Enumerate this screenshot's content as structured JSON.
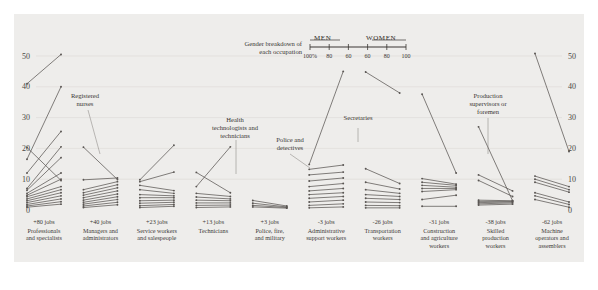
{
  "figure": {
    "background": "#eeedeb",
    "page_background": "#ffffff",
    "line_color": "#5a5653",
    "grid_color": "#dcd9d5"
  },
  "legend": {
    "title_line1": "Gender breakdown of",
    "title_line2": "each occupation",
    "men_label": "MEN",
    "women_label": "WOMEN",
    "ticks": [
      "100%",
      "80",
      "60",
      "60",
      "80",
      "100"
    ]
  },
  "annotations": [
    {
      "id": "registered-nurses",
      "text": "Registered\nnurses"
    },
    {
      "id": "health-technologists",
      "text": "Health\ntechnologists and\ntechnicians"
    },
    {
      "id": "police-and-detectives",
      "text": "Police and\ndetectives"
    },
    {
      "id": "secretaries",
      "text": "Secretaries"
    },
    {
      "id": "production-supervisors",
      "text": "Production\nsupervisors or\nforemen"
    }
  ],
  "chart_data": {
    "type": "line",
    "title": "",
    "subtitle": "",
    "xlabel": "",
    "ylabel": "",
    "ylim": [
      0,
      55
    ],
    "yticks": [
      0,
      10,
      20,
      30,
      40,
      50
    ],
    "ytick_labels": [
      "0",
      "10",
      "20",
      "30",
      "40",
      "50"
    ],
    "grid": true,
    "legend_position": "top-center",
    "axis_left_labels": [
      "0",
      "10",
      "20",
      "30",
      "40",
      "50"
    ],
    "axis_right_labels": [
      "0",
      "10",
      "20",
      "30",
      "40",
      "50"
    ],
    "x_endpoints": [
      "MEN",
      "WOMEN"
    ],
    "categories": [
      {
        "jobs": "+80 jobs",
        "name": "Professionals\nand specialists",
        "pairs": [
          [
            41.0,
            50.5
          ],
          [
            20.3,
            9.6
          ],
          [
            16.5,
            40.0
          ],
          [
            12.0,
            25.5
          ],
          [
            7.0,
            20.5
          ],
          [
            6.4,
            17.0
          ],
          [
            5.4,
            12.0
          ],
          [
            4.8,
            10.0
          ],
          [
            4.3,
            7.6
          ],
          [
            3.6,
            6.6
          ],
          [
            3.0,
            5.6
          ],
          [
            2.4,
            4.6
          ],
          [
            1.8,
            3.6
          ],
          [
            1.3,
            2.7
          ],
          [
            0.9,
            1.9
          ]
        ]
      },
      {
        "jobs": "+40 jobs",
        "name": "Managers and\nadministrators",
        "pairs": [
          [
            20.4,
            9.9
          ],
          [
            9.8,
            10.4
          ],
          [
            6.6,
            9.2
          ],
          [
            5.6,
            8.2
          ],
          [
            4.8,
            7.2
          ],
          [
            4.0,
            6.2
          ],
          [
            3.2,
            5.2
          ],
          [
            2.5,
            4.3
          ],
          [
            1.9,
            3.4
          ],
          [
            1.3,
            2.5
          ],
          [
            0.8,
            1.7
          ]
        ]
      },
      {
        "jobs": "+23 jobs",
        "name": "Service workers\nand salespeople",
        "pairs": [
          [
            9.8,
            21.0
          ],
          [
            9.2,
            12.3
          ],
          [
            8.0,
            6.3
          ],
          [
            6.6,
            5.4
          ],
          [
            5.0,
            4.6
          ],
          [
            4.0,
            4.0
          ],
          [
            3.0,
            3.2
          ],
          [
            2.2,
            2.5
          ],
          [
            1.4,
            1.8
          ],
          [
            0.8,
            1.2
          ]
        ]
      },
      {
        "jobs": "+13 jobs",
        "name": "Technicians",
        "pairs": [
          [
            12.2,
            5.6
          ],
          [
            7.6,
            20.5
          ],
          [
            5.4,
            4.4
          ],
          [
            4.2,
            3.6
          ],
          [
            3.2,
            3.0
          ],
          [
            2.3,
            2.3
          ],
          [
            1.5,
            1.6
          ],
          [
            0.8,
            1.0
          ]
        ]
      },
      {
        "jobs": "+3 jobs",
        "name": "Police, fire,\nand military",
        "pairs": [
          [
            3.1,
            1.3
          ],
          [
            2.2,
            1.0
          ],
          [
            1.5,
            0.8
          ],
          [
            1.0,
            0.6
          ]
        ]
      },
      {
        "jobs": "-3 jobs",
        "name": "Administrative\nsupport workers",
        "pairs": [
          [
            14.8,
            45.0
          ],
          [
            13.2,
            14.6
          ],
          [
            11.4,
            12.3
          ],
          [
            9.4,
            10.4
          ],
          [
            7.6,
            8.6
          ],
          [
            6.2,
            7.0
          ],
          [
            5.0,
            5.6
          ],
          [
            3.8,
            4.4
          ],
          [
            2.6,
            3.2
          ],
          [
            1.5,
            2.0
          ],
          [
            0.7,
            1.0
          ]
        ]
      },
      {
        "jobs": "-26 jobs",
        "name": "Transportation\nworkers",
        "pairs": [
          [
            44.8,
            38.0
          ],
          [
            13.4,
            8.6
          ],
          [
            9.0,
            6.8
          ],
          [
            6.6,
            5.4
          ],
          [
            5.0,
            4.4
          ],
          [
            3.8,
            3.4
          ],
          [
            2.6,
            2.4
          ],
          [
            1.5,
            1.4
          ],
          [
            0.7,
            0.7
          ]
        ]
      },
      {
        "jobs": "-31 jobs",
        "name": "Construction\nand agriculture\nworkers",
        "pairs": [
          [
            37.6,
            12.0
          ],
          [
            10.2,
            8.4
          ],
          [
            9.0,
            8.0
          ],
          [
            8.0,
            7.4
          ],
          [
            7.0,
            7.0
          ],
          [
            6.0,
            6.6
          ],
          [
            3.4,
            4.8
          ],
          [
            1.2,
            1.2
          ]
        ]
      },
      {
        "jobs": "-38 jobs",
        "name": "Skilled\nproduction\nworkers",
        "pairs": [
          [
            11.4,
            6.2
          ],
          [
            9.6,
            4.4
          ],
          [
            27.0,
            3.0
          ],
          [
            3.2,
            3.0
          ],
          [
            2.8,
            2.8
          ],
          [
            2.4,
            2.6
          ],
          [
            2.0,
            2.3
          ],
          [
            1.6,
            1.9
          ]
        ]
      },
      {
        "jobs": "-62 jobs",
        "name": "Machine\noperators and\nassemblers",
        "pairs": [
          [
            50.8,
            19.0
          ],
          [
            11.0,
            7.6
          ],
          [
            10.0,
            6.6
          ],
          [
            9.0,
            5.8
          ],
          [
            5.6,
            2.6
          ],
          [
            4.6,
            1.8
          ],
          [
            3.4,
            0.9
          ]
        ]
      }
    ]
  }
}
